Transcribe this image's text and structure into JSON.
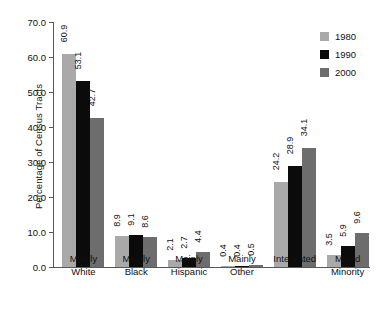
{
  "chart_data": {
    "type": "bar",
    "title": "",
    "xlabel": "",
    "ylabel": "Percentage of Census Tracts",
    "ylim": [
      0,
      70
    ],
    "ytick_labels": [
      "0.0",
      "10.0",
      "20.0",
      "30.0",
      "40.0",
      "50.0",
      "60.0",
      "70.0"
    ],
    "ytick_values": [
      0,
      10,
      20,
      30,
      40,
      50,
      60,
      70
    ],
    "grid": false,
    "legend_position": "top-right",
    "categories": [
      "Mainly White",
      "Mainly Black",
      "Mainly Hispanic",
      "Mainly Other",
      "Integrated",
      "Mixed Minority"
    ],
    "category_lines": [
      [
        "Mainly",
        "White"
      ],
      [
        "Mainly",
        "Black"
      ],
      [
        "Mainly",
        "Hispanic"
      ],
      [
        "Mainly",
        "Other"
      ],
      [
        "Integrated",
        ""
      ],
      [
        "Mixed",
        "Minority"
      ]
    ],
    "series": [
      {
        "name": "1980",
        "color": "#a9a9a9",
        "values": [
          60.9,
          8.9,
          2.1,
          0.4,
          24.2,
          3.5
        ],
        "labels": [
          "60.9",
          "8.9",
          "2.1",
          "0.4",
          "24.2",
          "3.5"
        ]
      },
      {
        "name": "1990",
        "color": "#0b0b0b",
        "values": [
          53.1,
          9.1,
          2.7,
          0.4,
          28.9,
          5.9
        ],
        "labels": [
          "53.1",
          "9.1",
          "2.7",
          "0.4",
          "28.9",
          "5.9"
        ]
      },
      {
        "name": "2000",
        "color": "#6d6d6d",
        "values": [
          42.7,
          8.6,
          4.4,
          0.5,
          34.1,
          9.6
        ],
        "labels": [
          "42.7",
          "8.6",
          "4.4",
          "0.5",
          "34.1",
          "9.6"
        ]
      }
    ]
  }
}
